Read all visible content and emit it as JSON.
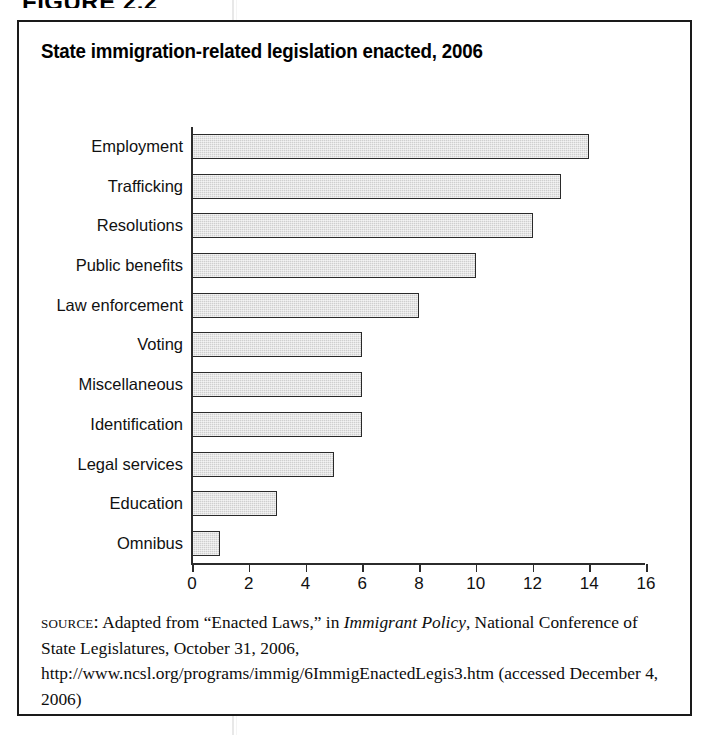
{
  "figure": {
    "caption": "FIGURE 2.2"
  },
  "chart_data": {
    "type": "bar",
    "orientation": "horizontal",
    "title": "State immigration-related legislation enacted, 2006",
    "xlabel": "",
    "ylabel": "",
    "categories": [
      "Employment",
      "Trafficking",
      "Resolutions",
      "Public benefits",
      "Law enforcement",
      "Voting",
      "Miscellaneous",
      "Identification",
      "Legal services",
      "Education",
      "Omnibus"
    ],
    "values": [
      14,
      13,
      12,
      10,
      8,
      6,
      6,
      6,
      5,
      3,
      1
    ],
    "xlim": [
      0,
      16
    ],
    "xticks": [
      0,
      2,
      4,
      6,
      8,
      10,
      12,
      14,
      16
    ],
    "xtick_labels": [
      "0",
      "2",
      "4",
      "6",
      "8",
      "10",
      "12",
      "14",
      "16"
    ],
    "grid": false,
    "legend": null,
    "bar_fill_color": "#cfcfcf",
    "bar_border_color": "#2a2a2a",
    "axis_color": "#2b2b2b"
  },
  "source": {
    "label": "Source:",
    "text_part1": " Adapted from “Enacted Laws,” in ",
    "italic_title": "Immigrant Policy",
    "text_part2": ", National Conference of State Legislatures, October 31, 2006, http://www.ncsl.org/programs/immig/6ImmigEnactedLegis3.htm (accessed December 4, 2006)"
  }
}
